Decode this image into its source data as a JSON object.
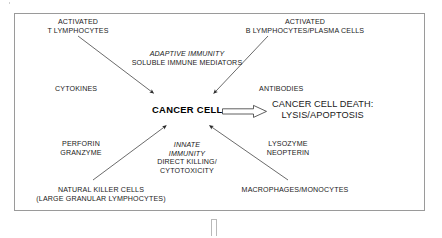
{
  "diagram": {
    "type": "concept-flow",
    "center_node": "CANCER CELL",
    "outcome": {
      "line1": "CANCER CELL DEATH:",
      "line2": "LYSIS/APOPTOSIS"
    },
    "groups": {
      "adaptive": {
        "heading_italic": "ADAPTIVE IMMUNITY",
        "heading_sub": "SOLUBLE IMMUNE MEDIATORS"
      },
      "innate": {
        "heading_italic_line1": "INNATE",
        "heading_italic_line2": "IMMUNITY",
        "heading_sub_line1": "DIRECT KILLING/",
        "heading_sub_line2": "CYTOTOXICITY"
      }
    },
    "sources": {
      "top_left": {
        "line1": "ACTIVATED",
        "line2": "T LYMPHOCYTES"
      },
      "top_right": {
        "line1": "ACTIVATED",
        "line2": "B LYMPHOCYTES/PLASMA CELLS"
      },
      "bottom_left": {
        "line1": "NATURAL KILLER CELLS",
        "line2": "(LARGE GRANULAR LYMPHOCYTES)"
      },
      "bottom_right": {
        "line1": "MACROPHAGES/MONOCYTES"
      }
    },
    "mediators": {
      "left_upper": "CYTOKINES",
      "right_upper": "ANTIBODIES",
      "left_lower": {
        "line1": "PERFORIN",
        "line2": "GRANZYME"
      },
      "right_lower": {
        "line1": "LYSOZYME",
        "line2": "NEOPTERIN"
      }
    },
    "icons": {
      "arrow_tl": "arrow-down-right-icon",
      "arrow_tr": "arrow-down-left-icon",
      "arrow_bl": "arrow-up-right-icon",
      "arrow_br": "arrow-up-left-icon",
      "outcome_arrow": "hollow-block-arrow-right-icon"
    },
    "colors": {
      "border": "#9a9a9a",
      "text": "#1a1a1a",
      "stroke": "#333333",
      "background": "#ffffff"
    }
  }
}
